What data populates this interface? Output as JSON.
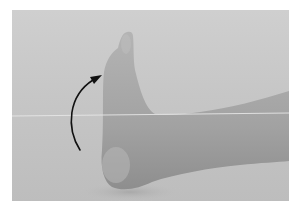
{
  "image": {
    "description": "Grayscale photograph of a foot in dorsiflexion with a curved arrow indicating upward motion",
    "subject": "foot-dorsiflexion",
    "annotation": "curved-arrow-upward",
    "colors": {
      "background": "#c8c8c8",
      "skin": "#a9a9a9",
      "skin_shadow": "#8c8c8c",
      "arrow": "#111111",
      "horizon_line": "#e6e6e6"
    }
  }
}
